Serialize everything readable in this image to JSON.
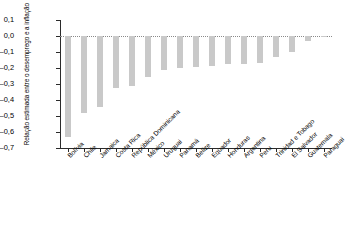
{
  "chart_data": {
    "type": "bar",
    "title": "",
    "subtitle": "",
    "xlabel": "",
    "ylabel": "Relação estimada entre o desemprego e a inflação",
    "ylim": [
      -0.7,
      0.1
    ],
    "yticks": [
      0.1,
      0.0,
      -0.1,
      -0.2,
      -0.3,
      -0.4,
      -0.5,
      -0.6,
      -0.7
    ],
    "ytick_labels": [
      "0,1",
      "0,0",
      "–0,1",
      "–0,2",
      "–0,3",
      "–0,4",
      "–0,5",
      "–0,6",
      "–0,7"
    ],
    "grid": false,
    "legend": "none",
    "zero_reference_line": true,
    "bar_color": "#c9c9c9",
    "axis_color": "#2b2b2b",
    "categories": [
      "Bolívia",
      "Chile",
      "Jamaica",
      "Costa Rica",
      "República Dominicana",
      "México",
      "Uruguai",
      "Panamá",
      "Belize",
      "Equador",
      "Honduras",
      "Argentina",
      "Peru",
      "Trinidad e Tobago",
      "El Salvador",
      "Guatemala",
      "Paraguai"
    ],
    "values": [
      -0.63,
      -0.48,
      -0.445,
      -0.325,
      -0.31,
      -0.255,
      -0.215,
      -0.2,
      -0.195,
      -0.185,
      -0.175,
      -0.175,
      -0.17,
      -0.13,
      -0.1,
      -0.03,
      -0.005
    ]
  }
}
